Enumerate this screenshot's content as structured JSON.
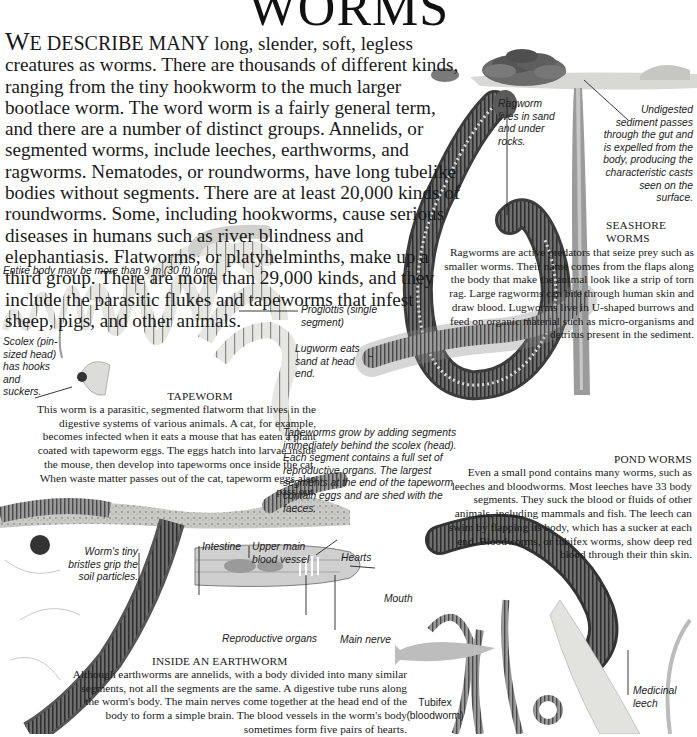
{
  "title": "WORMS",
  "intro": {
    "lead_letter": "W",
    "lead_caps": "E DESCRIBE MANY",
    "text": " long, slender, soft, legless creatures as worms. There are thousands of different kinds, ranging from the tiny hookworm to the much larger bootlace worm. The word worm is a fairly general term, and there are a number of distinct groups. Annelids, or segmented worms, include leeches, earthworms, and ragworms. Nematodes, or roundworms, have long tubelike bodies without segments. There are at least 20,000 kinds of roundworms. Some, including hookworms, cause serious diseases in humans such as river blindness and elephantiasis. Flatworms, or platyhelminths, make up a third group. There are more than 29,000 kinds, and they include the parasitic flukes and tapeworms that infest sheep, pigs, and other animals."
  },
  "tapeworm": {
    "length_caption": "Entire body may be more than 9 m (30 ft) long.",
    "proglottis_label": "Proglottis (single segment)",
    "scolex_label": "Scolex (pin-sized head) has hooks and suckers.",
    "heading": "TAPEWORM",
    "text": "This worm is a parasitic, segmented flatworm that lives in the digestive systems of various animals. A cat, for example, becomes infected when it eats a mouse that has eaten a plant coated with tapeworm eggs. The eggs hatch into larvae inside the mouse, then develop into tapeworms once inside the cat. When waste matter passes out of the cat, tapeworm eggs also pass out.",
    "growth_caption": "Tapeworms grow by adding segments immediately behind the scolex (head). Each segment contains a full set of reproductive organs. The largest segments at the end of the tapeworm contain eggs and are shed with the faeces."
  },
  "seashore": {
    "ragworm_label": "Ragworm lives in sand and under rocks.",
    "sediment_label": "Undigested sediment passes through the gut and is expelled from the body, producing the characteristic casts seen on the surface.",
    "lugworm_label": "Lugworm eats sand at head end.",
    "heading": "SEASHORE WORMS",
    "text": "Ragworms are active predators that seize prey such as smaller worms. Their name comes from the flaps along the body that make the animal look like a strip of torn rag. Large ragworms can bite through human skin and draw blood. Lugworms live in U-shaped burrows and feed on organic material such as micro-organisms and detritus present in the sediment."
  },
  "pond": {
    "heading": "POND WORMS",
    "text": "Even a small pond contains many worms, such as leeches and bloodworms. Most leeches have 33 body segments. They suck the blood or fluids of other animals, including mammals and fish. The leech can swim by flapping its body, which has a sucker at each end. Bloodworms, or tubifex worms, show deep red blood through their thin skin.",
    "tubifex_label": "Tubifex (bloodworm)",
    "leech_label": "Medicinal leech"
  },
  "earthworm": {
    "bristles_label": "Worm's tiny bristles grip the soil particles.",
    "diagram_labels": {
      "intestine": "Intestine",
      "blood_vessel": "Upper main blood vessel",
      "hearts": "Hearts",
      "mouth": "Mouth",
      "reproductive": "Reproductive organs",
      "nerve": "Main nerve"
    },
    "heading": "INSIDE AN EARTHWORM",
    "text": "Although earthworms are annelids, with a body divided into many similar segments, not all the segments are the same. A digestive tube runs along the worm's body. The main nerves come together at the head end of the body to form a simple brain. The blood vessels in the worm's body sometimes form five pairs of hearts."
  }
}
